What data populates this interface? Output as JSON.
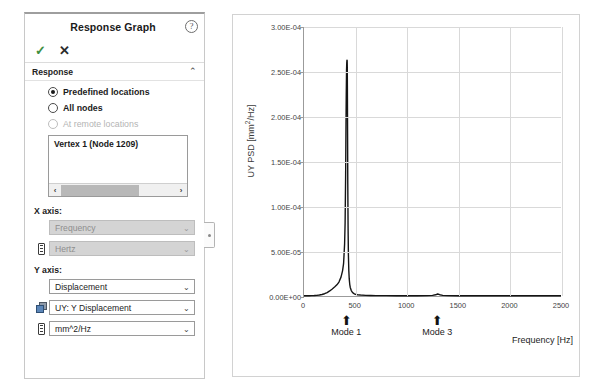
{
  "panel": {
    "title": "Response Graph",
    "help_icon": "help-circle-icon",
    "accept_label": "✓",
    "reject_label": "✕",
    "section": {
      "label": "Response",
      "collapse_caret": "⌃"
    },
    "options": [
      {
        "label": "Predefined locations",
        "selected": true,
        "enabled": true
      },
      {
        "label": "All nodes",
        "selected": false,
        "enabled": true
      },
      {
        "label": "At remote locations",
        "selected": false,
        "enabled": false
      }
    ],
    "location_list": {
      "items": [
        "Vertex 1 (Node 1209)"
      ],
      "scroll_left_arrow": "‹",
      "scroll_right_arrow": "›"
    },
    "x_axis": {
      "title": "X axis:",
      "quantity": {
        "value": "Frequency",
        "enabled": false,
        "caret": "⌄"
      },
      "unit": {
        "value": "Hertz",
        "enabled": false,
        "caret": "⌄",
        "icon": "ruler-icon"
      }
    },
    "y_axis": {
      "title": "Y axis:",
      "quantity": {
        "value": "Displacement",
        "enabled": true,
        "caret": "⌄"
      },
      "component": {
        "value": "UY: Y Displacement",
        "enabled": true,
        "caret": "⌄",
        "icon": "cube-icon"
      },
      "unit": {
        "value": "mm^2/Hz",
        "enabled": true,
        "caret": "⌄",
        "icon": "ruler-icon"
      }
    },
    "handle": "panel-collapse-handle"
  },
  "chart_data": {
    "type": "line",
    "title": "",
    "xlabel": "Frequency [Hz]",
    "ylabel": "UY PSD [mm²/Hz]",
    "ylabel_base": "UY PSD [mm",
    "ylabel_sup": "2",
    "ylabel_tail": "/Hz]",
    "xlim": [
      0,
      2500
    ],
    "ylim": [
      0,
      0.0003
    ],
    "grid": true,
    "legend": "none",
    "xticks": [
      0,
      500,
      1000,
      1500,
      2000,
      2500
    ],
    "xticklabels": [
      "0",
      "500",
      "1000",
      "1500",
      "2000",
      "2500"
    ],
    "yticks": [
      0,
      5e-05,
      0.0001,
      0.00015,
      0.0002,
      0.00025,
      0.0003
    ],
    "yticklabels": [
      "0.00E+00",
      "5.00E-05",
      "1.00E-04",
      "1.50E-04",
      "2.00E-04",
      "2.50E-04",
      "3.00E-04"
    ],
    "line_color": "#141414",
    "x": [
      0,
      25,
      50,
      75,
      100,
      125,
      150,
      175,
      200,
      225,
      250,
      275,
      300,
      320,
      340,
      360,
      375,
      385,
      395,
      400,
      405,
      408,
      411,
      414,
      416,
      418,
      419,
      420,
      421,
      422,
      424,
      426,
      429,
      432,
      436,
      440,
      445,
      450,
      460,
      470,
      480,
      490,
      500,
      520,
      550,
      600,
      650,
      700,
      800,
      900,
      1000,
      1100,
      1200,
      1250,
      1280,
      1300,
      1320,
      1350,
      1400,
      1500,
      1600,
      1700,
      1800,
      1900,
      2000,
      2100,
      2200,
      2300,
      2400,
      2500
    ],
    "y": [
      2e-07,
      2.2e-07,
      2.6e-07,
      3.4e-07,
      4.8e-07,
      7e-07,
      1.05e-06,
      1.6e-06,
      2.5e-06,
      3.8e-06,
      5.6e-06,
      7.8e-06,
      1.02e-05,
      1.24e-05,
      1.55e-05,
      2.1e-05,
      2.8e-05,
      3.6e-05,
      5.8e-05,
      8.2e-05,
      0.000135,
      0.000185,
      0.000225,
      0.000252,
      0.00026,
      0.000263,
      0.000263,
      0.000262,
      0.000255,
      0.000235,
      0.00018,
      0.000125,
      7.5e-05,
      4.6e-05,
      2.8e-05,
      1.9e-05,
      1.3e-05,
      9.5e-06,
      6e-06,
      4.2e-06,
      3.1e-06,
      2.4e-06,
      1.9e-06,
      1.4e-06,
      1e-06,
      7e-07,
      5.2e-07,
      4.2e-07,
      3.2e-07,
      2.8e-07,
      2.6e-07,
      2.8e-07,
      4e-07,
      6.5e-07,
      1.3e-06,
      2.2e-06,
      1.4e-06,
      7e-07,
      4e-07,
      2.6e-07,
      2.2e-07,
      2e-07,
      1.9e-07,
      1.8e-07,
      1.8e-07,
      1.7e-07,
      1.7e-07,
      1.6e-07,
      1.6e-07,
      1.6e-07
    ],
    "peak": {
      "frequency": 419,
      "value": 0.000263
    },
    "annotations": [
      {
        "label": "Mode 1",
        "x": 420,
        "arrow": "⬆"
      },
      {
        "label": "Mode 3",
        "x": 1300,
        "arrow": "⬆"
      }
    ]
  }
}
